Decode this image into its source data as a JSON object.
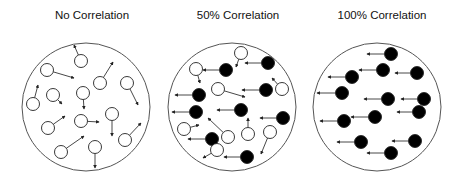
{
  "figure": {
    "width": 463,
    "height": 183,
    "colors": {
      "background": "#ffffff",
      "outline": "#555555",
      "arrow": "#333333",
      "filled_particle": "#000000",
      "open_particle": "#ffffff",
      "title": "#111111"
    },
    "particle_radius": 6.5,
    "panels": [
      {
        "title": "No Correlation",
        "title_center_x": 92,
        "boundary": {
          "cx": 86,
          "cy": 107,
          "r": 64
        },
        "particles": [
          {
            "x": 81,
            "y": 61,
            "tx": 74,
            "ty": 45,
            "filled": false
          },
          {
            "x": 47,
            "y": 70,
            "tx": 74,
            "ty": 78,
            "filled": false
          },
          {
            "x": 100,
            "y": 83,
            "tx": 113,
            "ty": 62,
            "filled": false
          },
          {
            "x": 127,
            "y": 83,
            "tx": 138,
            "ty": 105,
            "filled": false
          },
          {
            "x": 53,
            "y": 95,
            "tx": 62,
            "ty": 104,
            "filled": false
          },
          {
            "x": 83,
            "y": 93,
            "tx": 84,
            "ty": 109,
            "filled": false
          },
          {
            "x": 33,
            "y": 104,
            "tx": 38,
            "ty": 85,
            "filled": false
          },
          {
            "x": 112,
            "y": 114,
            "tx": 112,
            "ty": 136,
            "filled": false
          },
          {
            "x": 81,
            "y": 121,
            "tx": 99,
            "ty": 122,
            "filled": false
          },
          {
            "x": 48,
            "y": 128,
            "tx": 65,
            "ty": 116,
            "filled": false
          },
          {
            "x": 125,
            "y": 140,
            "tx": 141,
            "ty": 123,
            "filled": false
          },
          {
            "x": 61,
            "y": 152,
            "tx": 84,
            "ty": 136,
            "filled": false
          },
          {
            "x": 95,
            "y": 147,
            "tx": 95,
            "ty": 168,
            "filled": false
          }
        ]
      },
      {
        "title": "50% Correlation",
        "title_center_x": 238,
        "boundary": {
          "cx": 232,
          "cy": 107,
          "r": 64
        },
        "particles": [
          {
            "x": 241,
            "y": 53,
            "tx": 236,
            "ty": 67,
            "filled": false
          },
          {
            "x": 268,
            "y": 63,
            "tx": 245,
            "ty": 63,
            "filled": true
          },
          {
            "x": 226,
            "y": 70,
            "tx": 203,
            "ty": 70,
            "filled": true
          },
          {
            "x": 196,
            "y": 69,
            "tx": 200,
            "ty": 83,
            "filled": false
          },
          {
            "x": 266,
            "y": 90,
            "tx": 242,
            "ty": 90,
            "filled": true
          },
          {
            "x": 282,
            "y": 89,
            "tx": 272,
            "ty": 78,
            "filled": false
          },
          {
            "x": 218,
            "y": 89,
            "tx": 245,
            "ty": 97,
            "filled": false
          },
          {
            "x": 199,
            "y": 95,
            "tx": 175,
            "ty": 95,
            "filled": true
          },
          {
            "x": 196,
            "y": 112,
            "tx": 172,
            "ty": 112,
            "filled": true
          },
          {
            "x": 241,
            "y": 110,
            "tx": 217,
            "ty": 110,
            "filled": true
          },
          {
            "x": 283,
            "y": 118,
            "tx": 260,
            "ty": 118,
            "filled": true
          },
          {
            "x": 184,
            "y": 129,
            "tx": 199,
            "ty": 125,
            "filled": false
          },
          {
            "x": 228,
            "y": 137,
            "tx": 208,
            "ty": 118,
            "filled": false
          },
          {
            "x": 248,
            "y": 134,
            "tx": 248,
            "ty": 118,
            "filled": false
          },
          {
            "x": 270,
            "y": 132,
            "tx": 261,
            "ty": 154,
            "filled": false
          },
          {
            "x": 212,
            "y": 139,
            "tx": 188,
            "ty": 139,
            "filled": true
          },
          {
            "x": 217,
            "y": 150,
            "tx": 203,
            "ty": 158,
            "filled": false
          },
          {
            "x": 247,
            "y": 157,
            "tx": 224,
            "ty": 157,
            "filled": true
          }
        ]
      },
      {
        "title": "100% Correlation",
        "title_center_x": 382,
        "boundary": {
          "cx": 377,
          "cy": 107,
          "r": 64
        },
        "particles": [
          {
            "x": 391,
            "y": 54,
            "tx": 367,
            "ty": 54,
            "filled": true
          },
          {
            "x": 383,
            "y": 70,
            "tx": 359,
            "ty": 70,
            "filled": true
          },
          {
            "x": 417,
            "y": 73,
            "tx": 395,
            "ty": 73,
            "filled": true
          },
          {
            "x": 352,
            "y": 77,
            "tx": 328,
            "ty": 77,
            "filled": true
          },
          {
            "x": 342,
            "y": 93,
            "tx": 317,
            "ty": 93,
            "filled": true
          },
          {
            "x": 388,
            "y": 99,
            "tx": 364,
            "ty": 99,
            "filled": true
          },
          {
            "x": 424,
            "y": 99,
            "tx": 401,
            "ty": 99,
            "filled": true
          },
          {
            "x": 419,
            "y": 112,
            "tx": 397,
            "ty": 112,
            "filled": true
          },
          {
            "x": 375,
            "y": 117,
            "tx": 351,
            "ty": 117,
            "filled": true
          },
          {
            "x": 344,
            "y": 121,
            "tx": 320,
            "ty": 121,
            "filled": true
          },
          {
            "x": 361,
            "y": 142,
            "tx": 337,
            "ty": 142,
            "filled": true
          },
          {
            "x": 415,
            "y": 141,
            "tx": 392,
            "ty": 141,
            "filled": true
          },
          {
            "x": 391,
            "y": 153,
            "tx": 367,
            "ty": 153,
            "filled": true
          }
        ]
      }
    ]
  }
}
